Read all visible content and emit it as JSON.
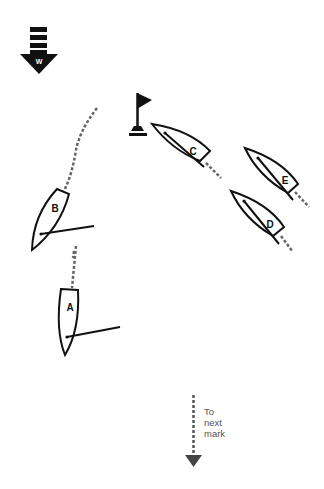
{
  "diagram": {
    "type": "sailing-race-rounding",
    "colors": {
      "ink": "#111111",
      "wake": "#666666",
      "note": "#555555",
      "background": "#ffffff"
    },
    "wind": {
      "icon": "wind-arrow-icon",
      "label": "W",
      "direction": "down"
    },
    "mark": {
      "icon": "flag-mark-icon"
    },
    "boats": [
      {
        "id": "A",
        "label": "A"
      },
      {
        "id": "B",
        "label": "B"
      },
      {
        "id": "C",
        "label": "C"
      },
      {
        "id": "D",
        "label": "D"
      },
      {
        "id": "E",
        "label": "E"
      }
    ],
    "next_mark": {
      "icon": "dashed-arrow-down-icon",
      "lines": [
        "To",
        "next",
        "mark"
      ]
    }
  }
}
